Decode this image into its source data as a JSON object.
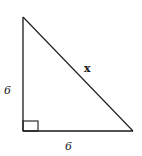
{
  "diagram": {
    "type": "right-triangle",
    "stroke_color": "#1a1a1a",
    "labels": {
      "left_leg": "6",
      "bottom_leg": "6",
      "hypotenuse": "x"
    },
    "right_angle_marker": true
  }
}
